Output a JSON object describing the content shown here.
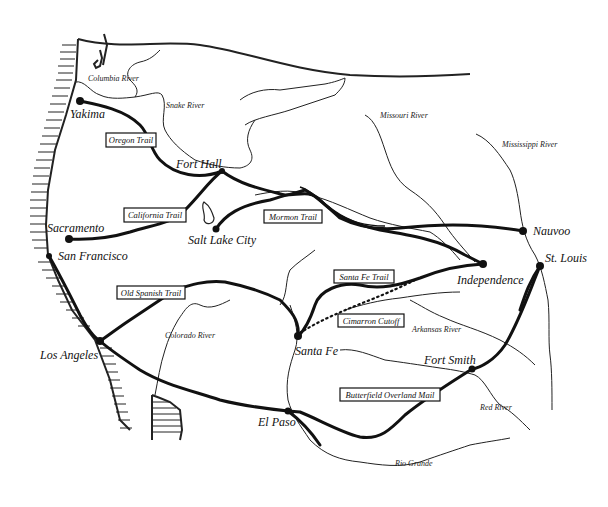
{
  "map": {
    "title_partial": "",
    "background": "#ffffff",
    "ink_color": "#111111"
  },
  "cities": [
    {
      "name": "Yakima",
      "x": 80,
      "y": 101
    },
    {
      "name": "Fort Hall",
      "x": 222,
      "y": 171
    },
    {
      "name": "Sacramento",
      "x": 69,
      "y": 239
    },
    {
      "name": "San Francisco",
      "x": 49,
      "y": 256
    },
    {
      "name": "Salt Lake City",
      "x": 216,
      "y": 229
    },
    {
      "name": "Nauvoo",
      "x": 523,
      "y": 231
    },
    {
      "name": "Independence",
      "x": 483,
      "y": 264
    },
    {
      "name": "St. Louis",
      "x": 540,
      "y": 266
    },
    {
      "name": "Los Angeles",
      "x": 100,
      "y": 341
    },
    {
      "name": "Santa Fe",
      "x": 298,
      "y": 336
    },
    {
      "name": "Fort Smith",
      "x": 472,
      "y": 369
    },
    {
      "name": "El Paso",
      "x": 288,
      "y": 411
    }
  ],
  "trails": [
    {
      "name": "Oregon Trail"
    },
    {
      "name": "California Trail"
    },
    {
      "name": "Mormon Trail"
    },
    {
      "name": "Santa Fe Trail"
    },
    {
      "name": "Old Spanish Trail"
    },
    {
      "name": "Cimarron Cutoff"
    },
    {
      "name": "Butterfield Overland Mail"
    }
  ],
  "rivers": [
    {
      "name": "Columbia River"
    },
    {
      "name": "Snake River"
    },
    {
      "name": "Missouri River"
    },
    {
      "name": "Mississippi River"
    },
    {
      "name": "Colorado River"
    },
    {
      "name": "Arkansas River"
    },
    {
      "name": "Red River"
    },
    {
      "name": "Rio Grande"
    }
  ]
}
